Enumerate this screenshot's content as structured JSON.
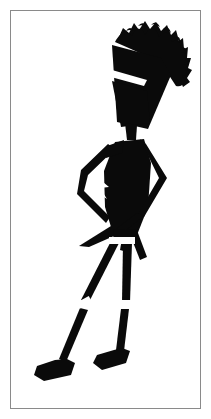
{
  "artwork": {
    "title": "Silhouette of a Stylized Standing Figure",
    "subject": "stylized human figure silhouette with tall spiky hair, arms akimbo, long thin legs and wedge shoes",
    "style": "high-contrast black ink silhouette on white",
    "alt_text": "Black silhouette of a tall thin figure with a large spiky hairstyle, hands on hips, standing on long slender legs with wedge shoes",
    "canvas": {
      "width": 211,
      "height": 419,
      "background_color": "#ffffff"
    },
    "frame": {
      "border_color": "#8a8a8a",
      "border_width": 1,
      "inset": 10,
      "fill_color": "#ffffff"
    },
    "ink_color": "#0a0a0a",
    "negative_color": "#ffffff",
    "parts": [
      {
        "name": "hair",
        "label": "Spiky Hair"
      },
      {
        "name": "head",
        "label": "Head"
      },
      {
        "name": "face-notch",
        "label": "Face Notch"
      },
      {
        "name": "neck",
        "label": "Neck"
      },
      {
        "name": "torso",
        "label": "Torso"
      },
      {
        "name": "torso-notch",
        "label": "Torso Highlight"
      },
      {
        "name": "left-arm",
        "label": "Left Arm Akimbo"
      },
      {
        "name": "right-arm",
        "label": "Right Arm Akimbo"
      },
      {
        "name": "coat-tails",
        "label": "Coat Tails"
      },
      {
        "name": "left-leg",
        "label": "Left Leg"
      },
      {
        "name": "right-leg",
        "label": "Right Leg"
      },
      {
        "name": "left-shoe",
        "label": "Left Wedge Shoe"
      },
      {
        "name": "right-shoe",
        "label": "Right Wedge Shoe"
      }
    ]
  }
}
